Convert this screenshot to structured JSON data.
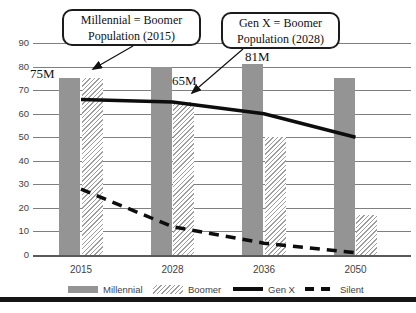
{
  "chart_data": {
    "type": "bar",
    "title": "",
    "xlabel": "",
    "ylabel": "",
    "categories": [
      "2015",
      "2028",
      "2036",
      "2050"
    ],
    "series": [
      {
        "name": "Millennial",
        "type": "bar",
        "swatch": "solid-gray",
        "values": [
          75,
          80,
          81,
          75
        ]
      },
      {
        "name": "Boomer",
        "type": "bar",
        "swatch": "hatched",
        "values": [
          75,
          65,
          50,
          17
        ]
      },
      {
        "name": "Gen X",
        "type": "line",
        "swatch": "solid-line",
        "values": [
          66,
          65,
          60,
          50
        ]
      },
      {
        "name": "Silent",
        "type": "line",
        "swatch": "dashed-line",
        "values": [
          28,
          12,
          5,
          1
        ]
      }
    ],
    "ylim": [
      0,
      90
    ],
    "yticks": [
      0,
      10,
      20,
      30,
      40,
      50,
      60,
      70,
      80,
      90
    ],
    "grid": true,
    "legend_position": "bottom",
    "annotations": [
      {
        "text": "75M"
      },
      {
        "text": "65M"
      },
      {
        "text": "81M"
      }
    ],
    "callouts": [
      {
        "line1": "Millennial = Boomer",
        "line2": "Population (2015)"
      },
      {
        "line1": "Gen X = Boomer",
        "line2": "Population (2028)"
      }
    ]
  },
  "colors": {
    "bar_gray": "#949494",
    "hatch_line": "#9e9e9e",
    "gridline": "#7f7f7f",
    "axis": "#5a5a5a",
    "line_black": "#0d0d0d",
    "text": "#3f3f3f"
  }
}
